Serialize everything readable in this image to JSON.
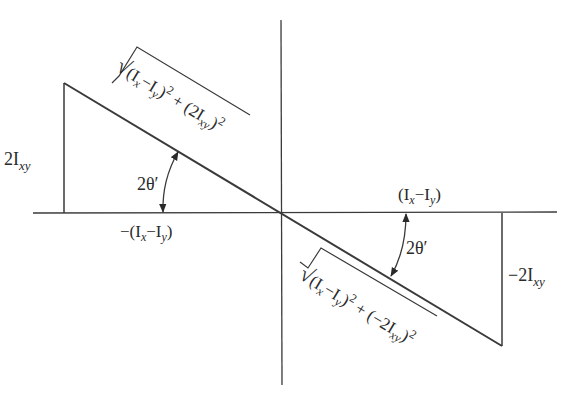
{
  "figure": {
    "type": "mohr-circle-like principal axes triangle diagram",
    "colors": {
      "stroke": "#3a3a3a",
      "text": "#2a2a2a",
      "background": "#ffffff"
    }
  },
  "labels": {
    "left_height": {
      "main": "2I",
      "sub": "xy"
    },
    "left_base": {
      "prefix": "−(I",
      "sub1": "x",
      "mid": "−I",
      "sub2": "y",
      "suffix": ")"
    },
    "left_angle": "2θ′",
    "left_hypotenuse": {
      "root": "√",
      "t1": "(I",
      "s1": "x",
      "t2": "−I",
      "s2": "y",
      "t3": ")",
      "p1": "2",
      "t4": " + (2I",
      "s3": "xy",
      "t5": ")",
      "p2": "2"
    },
    "right_base": {
      "prefix": "(I",
      "sub1": "x",
      "mid": "−I",
      "sub2": "y",
      "suffix": ")"
    },
    "right_height": {
      "main": "−2I",
      "sub": "xy"
    },
    "right_angle": "2θ′",
    "right_hypotenuse": {
      "root": "√",
      "t1": "(I",
      "s1": "x",
      "t2": "−I",
      "s2": "y",
      "t3": ")",
      "p1": "2",
      "t4": " + (−2I",
      "s3": "xy",
      "t5": ")",
      "p2": "2"
    }
  },
  "geometry": {
    "origin": [
      282,
      213
    ],
    "x_axis": [
      33,
      557
    ],
    "y_axis": [
      20,
      385
    ],
    "left_triangle": {
      "top": [
        64,
        83
      ],
      "base": [
        64,
        213
      ]
    },
    "right_triangle": {
      "bottom": [
        502,
        346
      ],
      "base": [
        502,
        213
      ]
    }
  }
}
